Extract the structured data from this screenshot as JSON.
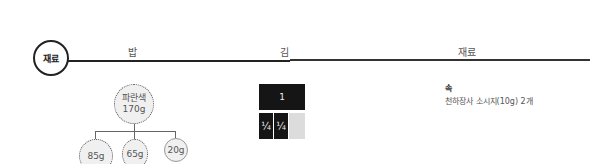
{
  "header": {
    "badge_label": "재료",
    "columns": [
      "밥",
      "김",
      "재료"
    ]
  },
  "rice": {
    "main": {
      "name": "파란색",
      "amount": "170g"
    },
    "portions": [
      "85g",
      "65g",
      "20g"
    ]
  },
  "nori": {
    "full": "1",
    "quarters": [
      "¼",
      "¼"
    ]
  },
  "ingredients": {
    "section_title": "속",
    "items": [
      "천하장사 소시지(10g) 2개"
    ]
  }
}
